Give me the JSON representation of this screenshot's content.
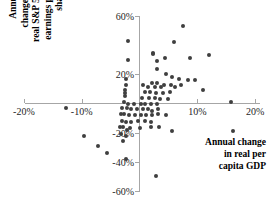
{
  "chart_data": {
    "type": "scatter",
    "title": "",
    "xlabel": "Annual change in real per capita GDP",
    "ylabel": "Annual change in real S&P 500 earnings per share",
    "xlabel_lines": "Annual change\nin real per\ncapita GDP",
    "ylabel_lines": "Annual\nchange in\nreal S&P 500\nearnings per\nshare",
    "grid": false,
    "legend": "none",
    "axes_cross_at_origin": true,
    "xlim": [
      -24,
      22
    ],
    "ylim": [
      -66,
      62
    ],
    "xticks": [
      -20,
      -10,
      10,
      20
    ],
    "yticks": [
      60,
      20,
      -20,
      -40,
      -60
    ],
    "xtick_labels": [
      "-20%",
      "-10%",
      "10%",
      "20%"
    ],
    "ytick_labels": [
      "60%",
      "20%",
      "-20%",
      "-40%",
      "-60%"
    ],
    "marker": "circle",
    "marker_color": "#3f3f3f",
    "axis_color": "#a6a6a6",
    "points": [
      [
        7.6,
        53
      ],
      [
        -2.0,
        43
      ],
      [
        5.9,
        42
      ],
      [
        2.4,
        35
      ],
      [
        2.4,
        34
      ],
      [
        12.0,
        33
      ],
      [
        4.4,
        31
      ],
      [
        3.1,
        29
      ],
      [
        -2.0,
        30
      ],
      [
        8.8,
        31
      ],
      [
        3.0,
        24
      ],
      [
        4.6,
        20
      ],
      [
        -2.3,
        17
      ],
      [
        5.6,
        18
      ],
      [
        6.8,
        17
      ],
      [
        8.4,
        16
      ],
      [
        9.6,
        16
      ],
      [
        -2.4,
        13
      ],
      [
        0.6,
        13
      ],
      [
        2.2,
        14
      ],
      [
        3.0,
        14
      ],
      [
        4.2,
        13
      ],
      [
        5.4,
        13
      ],
      [
        7.2,
        13
      ],
      [
        1.4,
        11
      ],
      [
        2.6,
        11
      ],
      [
        3.8,
        11
      ],
      [
        6.2,
        11
      ],
      [
        -2.5,
        9
      ],
      [
        -2.5,
        7
      ],
      [
        -2.5,
        5
      ],
      [
        0.9,
        8
      ],
      [
        1.8,
        8
      ],
      [
        2.8,
        7
      ],
      [
        4.0,
        7
      ],
      [
        5.2,
        8
      ],
      [
        11.0,
        9
      ],
      [
        0.4,
        4
      ],
      [
        1.6,
        4
      ],
      [
        2.6,
        4
      ],
      [
        3.6,
        3
      ],
      [
        5.0,
        3
      ],
      [
        -2.6,
        1
      ],
      [
        -2.0,
        0
      ],
      [
        -1.0,
        0
      ],
      [
        0.2,
        0
      ],
      [
        1.0,
        0
      ],
      [
        2.0,
        0
      ],
      [
        3.0,
        0
      ],
      [
        15.8,
        1
      ],
      [
        -3.0,
        -3
      ],
      [
        -2.2,
        -3
      ],
      [
        -1.4,
        -4
      ],
      [
        -0.4,
        -4
      ],
      [
        0.6,
        -4
      ],
      [
        1.4,
        -4
      ],
      [
        2.2,
        -5
      ],
      [
        3.2,
        -4
      ],
      [
        -12.8,
        -3
      ],
      [
        -3.2,
        -7
      ],
      [
        -2.6,
        -7
      ],
      [
        -1.8,
        -8
      ],
      [
        -0.8,
        -8
      ],
      [
        0.2,
        -8
      ],
      [
        1.2,
        -8
      ],
      [
        2.2,
        -8
      ],
      [
        3.2,
        -7
      ],
      [
        4.6,
        -8
      ],
      [
        -3.0,
        -12
      ],
      [
        -2.4,
        -13
      ],
      [
        -1.4,
        -13
      ],
      [
        -0.2,
        -12
      ],
      [
        1.0,
        -12
      ],
      [
        2.0,
        -13
      ],
      [
        -3.4,
        -16
      ],
      [
        -2.8,
        -16
      ],
      [
        -1.6,
        -17
      ],
      [
        0.0,
        -17
      ],
      [
        2.0,
        -16
      ],
      [
        5.6,
        -19
      ],
      [
        -3.2,
        -21
      ],
      [
        -2.4,
        -22
      ],
      [
        -9.6,
        -22
      ],
      [
        -2.8,
        -26
      ],
      [
        -7.2,
        -29
      ],
      [
        -5.6,
        -34
      ],
      [
        -2.4,
        -38
      ],
      [
        2.8,
        -50
      ],
      [
        16.2,
        -19
      ],
      [
        -2.2,
        -18
      ],
      [
        3.4,
        -16
      ]
    ]
  },
  "axis_titles": {
    "y": "Annual\nchange in\nreal S&P 500\nearnings per\nshare",
    "x": "Annual change\nin real per\ncapita GDP"
  }
}
